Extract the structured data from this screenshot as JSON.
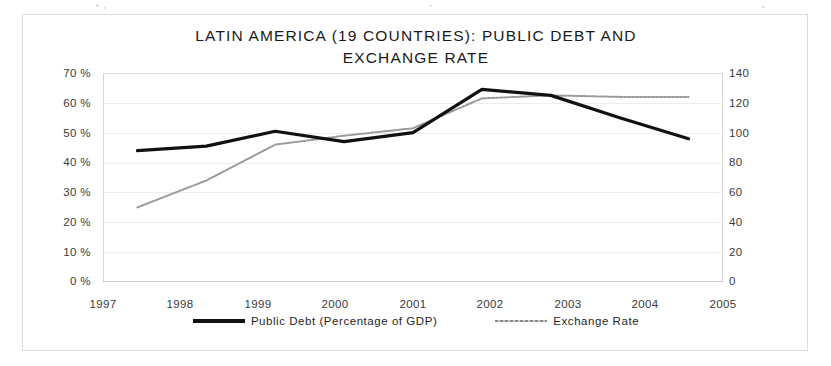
{
  "chart_data": {
    "type": "line",
    "title": "LATIN AMERICA (19 COUNTRIES): PUBLIC DEBT AND EXCHANGE RATE",
    "title_line1": "LATIN AMERICA (19 COUNTRIES): PUBLIC DEBT AND",
    "title_line2": "EXCHANGE RATE",
    "xlabel": "",
    "ylabel": "",
    "categories": [
      "1997",
      "1998",
      "1999",
      "2000",
      "2001",
      "2002",
      "2003",
      "2004",
      "2005"
    ],
    "grid": true,
    "legend_position": "bottom",
    "axes": {
      "left": {
        "label": "",
        "ylim": [
          0,
          70
        ],
        "tick_step": 10,
        "ticks": [
          "0 %",
          "10 %",
          "20 %",
          "30 %",
          "40 %",
          "50 %",
          "60 %",
          "70 %"
        ],
        "tick_values": [
          0,
          10,
          20,
          30,
          40,
          50,
          60,
          70
        ]
      },
      "right": {
        "label": "",
        "ylim": [
          0,
          140
        ],
        "tick_step": 20,
        "ticks": [
          "0",
          "20",
          "40",
          "60",
          "80",
          "100",
          "120",
          "140"
        ],
        "tick_values": [
          0,
          20,
          40,
          60,
          80,
          100,
          120,
          140
        ]
      }
    },
    "series": [
      {
        "name": "Public Debt (Percentage of GDP)",
        "axis": "left",
        "color": "#111111",
        "style": "solid-thick",
        "values": [
          44,
          45.5,
          50.5,
          47,
          50,
          64.5,
          62.5,
          55,
          48
        ]
      },
      {
        "name": "Exchange Rate",
        "axis": "right",
        "color": "#9a9a9a",
        "style": "dotted-thin",
        "values": [
          50,
          68,
          92,
          98,
          103,
          123,
          125,
          124,
          124
        ]
      }
    ]
  },
  "legend": {
    "items": [
      {
        "label": "Public Debt (Percentage of GDP)",
        "swatch": "thick-black-line"
      },
      {
        "label": "Exchange Rate",
        "swatch": "thin-gray-dotted-line"
      }
    ]
  }
}
